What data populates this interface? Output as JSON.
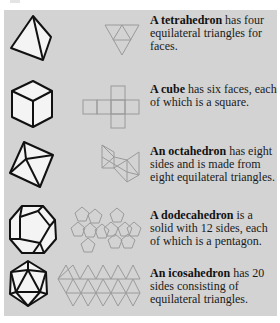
{
  "figure": {
    "background_color": "#d3d3d3",
    "solid_stroke_color": "#111111",
    "solid_fill_color": "#f4f4f4",
    "net_stroke_color": "#9a9a9a",
    "rows": [
      {
        "solid": "tetrahedron",
        "icon": "tetrahedron-icon",
        "net_icon": "tetrahedron-net-icon",
        "term": "A tetrahedron",
        "text": " has four equilateral triangles for faces."
      },
      {
        "solid": "cube",
        "icon": "cube-icon",
        "net_icon": "cube-net-icon",
        "term": "A cube",
        "text": " has six faces, each of which is a square."
      },
      {
        "solid": "octahedron",
        "icon": "octahedron-icon",
        "net_icon": "octahedron-net-icon",
        "term": "An octahedron",
        "text": " has eight sides and is made from eight equilateral triangles."
      },
      {
        "solid": "dodecahedron",
        "icon": "dodecahedron-icon",
        "net_icon": "dodecahedron-net-icon",
        "term": "A dodecahedron",
        "text": " is a solid with 12 sides, each of which is a pentagon."
      },
      {
        "solid": "icosahedron",
        "icon": "icosahedron-icon",
        "net_icon": "icosahedron-net-icon",
        "term": "An icosahedron",
        "text": " has 20 sides consisting of equilateral triangles."
      }
    ]
  }
}
